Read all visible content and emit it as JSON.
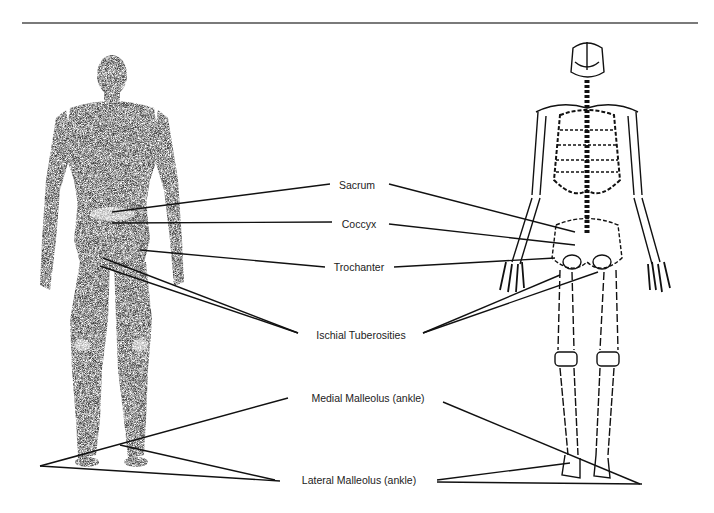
{
  "figure": {
    "left_figure": "muscular-body-posterior-view",
    "right_figure": "skeleton-posterior-view",
    "line_color": "#111111",
    "rule_color": "#7a7a7a",
    "body_color": "#3c3c3c"
  },
  "labels": [
    {
      "id": "sacrum",
      "text": "Sacrum",
      "x": 357,
      "y": 179
    },
    {
      "id": "coccyx",
      "text": "Coccyx",
      "x": 359,
      "y": 218
    },
    {
      "id": "trochanter",
      "text": "Trochanter",
      "x": 359,
      "y": 261
    },
    {
      "id": "ischial",
      "text": "Ischial Tuberosities",
      "x": 361,
      "y": 329
    },
    {
      "id": "medial",
      "text": "Medial Malleolus (ankle)",
      "x": 368,
      "y": 392
    },
    {
      "id": "lateral",
      "text": "Lateral Malleolus (ankle)",
      "x": 359,
      "y": 474
    }
  ]
}
